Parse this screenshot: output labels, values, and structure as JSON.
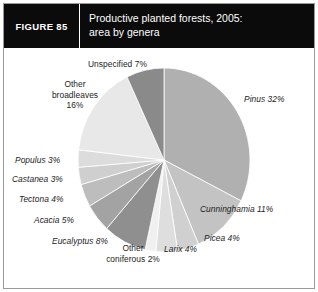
{
  "figure": {
    "tag": "FIGURE 85",
    "title_line_1": "Productive planted forests, 2005:",
    "title_line_2": "area by genera"
  },
  "colors": {
    "header_background": "#0b0b0b",
    "header_text": "#ffffff",
    "frame": "#9a9a9a",
    "plot_background": "#ffffff",
    "label_text": "#1d1d1d"
  },
  "chart_data": {
    "type": "pie",
    "title": "Productive planted forests, 2005: area by genera",
    "unit": "percent of area",
    "total": 100,
    "start_angle_deg": 0,
    "direction": "clockwise",
    "legend": "none (direct labels)",
    "grid": false,
    "categories": [
      "Pinus",
      "Cunninghamia",
      "Picea",
      "Larix",
      "Other coniferous",
      "Eucalyptus",
      "Acacia",
      "Tectona",
      "Castanea",
      "Populus",
      "Other broadleaves",
      "Unspecified"
    ],
    "values": [
      32,
      11,
      4,
      4,
      2,
      8,
      5,
      4,
      3,
      3,
      16,
      7
    ],
    "slice_colors": [
      "#b0b0b0",
      "#c3c3c3",
      "#d0d0d0",
      "#dedede",
      "#f0f0f0",
      "#8f8f8f",
      "#a3a3a3",
      "#bdbdbd",
      "#cfcfcf",
      "#dcdcdc",
      "#e8e8e8",
      "#8a8a8a"
    ],
    "slices": [
      {
        "label": "Pinus 32%",
        "name": "Pinus",
        "value": 32,
        "color": "#b0b0b0"
      },
      {
        "label": "Cunninghamia 11%",
        "name": "Cunninghamia",
        "value": 11,
        "color": "#c3c3c3"
      },
      {
        "label": "Picea 4%",
        "name": "Picea",
        "value": 4,
        "color": "#d0d0d0"
      },
      {
        "label": "Larix 4%",
        "name": "Larix",
        "value": 4,
        "color": "#dedede"
      },
      {
        "label": "Other coniferous 2%",
        "name": "Other coniferous",
        "value": 2,
        "color": "#f0f0f0"
      },
      {
        "label": "Eucalyptus 8%",
        "name": "Eucalyptus",
        "value": 8,
        "color": "#8f8f8f"
      },
      {
        "label": "Acacia 5%",
        "name": "Acacia",
        "value": 5,
        "color": "#a3a3a3"
      },
      {
        "label": "Tectona 4%",
        "name": "Tectona",
        "value": 4,
        "color": "#bdbdbd"
      },
      {
        "label": "Castanea 3%",
        "name": "Castanea",
        "value": 3,
        "color": "#cfcfcf"
      },
      {
        "label": "Populus 3%",
        "name": "Populus",
        "value": 3,
        "color": "#dcdcdc"
      },
      {
        "label": "Other broadleaves 16%",
        "name": "Other broadleaves",
        "value": 16,
        "color": "#e8e8e8"
      },
      {
        "label": "Unspecified 7%",
        "name": "Unspecified",
        "value": 7,
        "color": "#8a8a8a"
      }
    ],
    "labels": {
      "pinus": "Pinus 32%",
      "cunninghamia": "Cunninghamia 11%",
      "picea": "Picea 4%",
      "larix": "Larix 4%",
      "other_coniferous_line1": "Other",
      "other_coniferous_line2": "coniferous 2%",
      "eucalyptus": "Eucalyptus 8%",
      "acacia": "Acacia 5%",
      "tectona": "Tectona 4%",
      "castanea": "Castanea  3%",
      "populus": "Populus 3%",
      "other_broadleaves_line1": "Other",
      "other_broadleaves_line2": "broadleaves",
      "other_broadleaves_line3": "16%",
      "unspecified": "Unspecified 7%"
    }
  }
}
